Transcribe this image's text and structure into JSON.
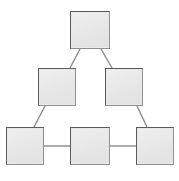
{
  "diagram": {
    "type": "node-link-graph",
    "canvas": {
      "width": 179,
      "height": 181,
      "background": "#ffffff"
    },
    "style": {
      "node_fill": "#e9e9e9",
      "node_border": "#5a5a5a",
      "node_shadow": "#8f8f8f",
      "edge_color": "#8a8a8a",
      "edge_width": 1.4
    },
    "nodes": [
      {
        "id": "top",
        "label": "",
        "x": 70,
        "y": 11,
        "w": 40,
        "h": 38
      },
      {
        "id": "middle-left",
        "label": "",
        "x": 38,
        "y": 68,
        "w": 38,
        "h": 38
      },
      {
        "id": "middle-right",
        "label": "",
        "x": 105,
        "y": 68,
        "w": 38,
        "h": 38
      },
      {
        "id": "bottom-left",
        "label": "",
        "x": 6,
        "y": 127,
        "w": 38,
        "h": 38
      },
      {
        "id": "bottom-middle",
        "label": "",
        "x": 70,
        "y": 127,
        "w": 40,
        "h": 38
      },
      {
        "id": "bottom-right",
        "label": "",
        "x": 136,
        "y": 127,
        "w": 38,
        "h": 38
      }
    ],
    "edges": [
      {
        "id": "edge-top-middleleft",
        "from": "top",
        "to": "middle-left",
        "kind": "diagonal",
        "x1": 80,
        "y1": 49,
        "x2": 70,
        "y2": 68
      },
      {
        "id": "edge-top-middleright",
        "from": "top",
        "to": "middle-right",
        "kind": "diagonal",
        "x1": 101,
        "y1": 49,
        "x2": 112,
        "y2": 68
      },
      {
        "id": "edge-middleleft-bottomleft",
        "from": "middle-left",
        "to": "bottom-left",
        "kind": "diagonal",
        "x1": 45,
        "y1": 106,
        "x2": 34,
        "y2": 127
      },
      {
        "id": "edge-middleright-bottomright",
        "from": "middle-right",
        "to": "bottom-right",
        "kind": "diagonal",
        "x1": 137,
        "y1": 106,
        "x2": 147,
        "y2": 127
      },
      {
        "id": "edge-bottomleft-bottommiddle",
        "from": "bottom-left",
        "to": "bottom-middle",
        "kind": "horizontal",
        "x1": 44,
        "y1": 146,
        "x2": 70,
        "y2": 146
      },
      {
        "id": "edge-bottommiddle-bottomright",
        "from": "bottom-middle",
        "to": "bottom-right",
        "kind": "horizontal",
        "x1": 110,
        "y1": 146,
        "x2": 136,
        "y2": 146
      }
    ]
  }
}
